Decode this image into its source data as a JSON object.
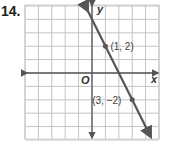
{
  "problem_number": "14.",
  "chart_data": {
    "type": "line",
    "title": "",
    "xlabel": "x",
    "ylabel": "y",
    "origin_label": "O",
    "xlim": [
      -5,
      5
    ],
    "ylim": [
      -5,
      5
    ],
    "grid": true,
    "points": [
      {
        "x": 1,
        "y": 2,
        "label": "(1, 2)"
      },
      {
        "x": 3,
        "y": -2,
        "label": "(3, −2)"
      }
    ],
    "line": {
      "slope": -2,
      "intercept": 4,
      "x_range": [
        -0.3,
        4.4
      ]
    },
    "colors": {
      "line": "#555555",
      "grid": "#bfbfbf",
      "axis": "#555555"
    }
  }
}
